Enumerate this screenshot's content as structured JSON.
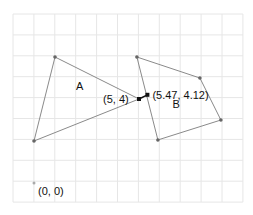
{
  "diagram": {
    "grid": {
      "x0": 13,
      "y0": 14,
      "step": 20.9,
      "cols": 11,
      "rows": 9,
      "color": "#e6e6e6"
    },
    "origin_px": {
      "x": 34,
      "y": 183
    },
    "scale": 21,
    "shapes": [
      {
        "name": "A",
        "label": "A",
        "label_pos": [
          2.0,
          4.45
        ],
        "vertices": [
          [
            1.0,
            6.0
          ],
          [
            0.0,
            2.0
          ],
          [
            5.0,
            4.0
          ]
        ],
        "stroke": "#8a8a8a"
      },
      {
        "name": "B",
        "label": "B",
        "label_pos": [
          6.6,
          3.55
        ],
        "vertices": [
          [
            4.9,
            6.0
          ],
          [
            7.9,
            5.0
          ],
          [
            8.9,
            3.0
          ],
          [
            5.9,
            2.05
          ]
        ],
        "stroke": "#8a8a8a"
      }
    ],
    "points": [
      {
        "id": "p1",
        "label": "(5, 4)",
        "x": 5.0,
        "y": 4.0,
        "label_dx": -36,
        "label_dy": 4
      },
      {
        "id": "p2",
        "label": "(5.47, 4.12)",
        "x": 5.4,
        "y": 4.2,
        "label_dx": 5,
        "label_dy": 4
      },
      {
        "id": "origin",
        "label": "(0, 0)",
        "x": 0.0,
        "y": 0.0,
        "label_dx": 4,
        "label_dy": 12
      }
    ],
    "connector": {
      "from": "p1",
      "to": "p2",
      "color": "#111111"
    }
  }
}
